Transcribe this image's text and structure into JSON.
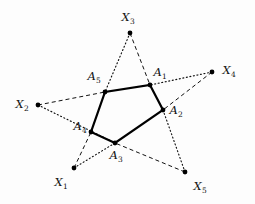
{
  "figure": {
    "background_color": "#fdfdfd",
    "stroke_color": "#111111",
    "width": 255,
    "height": 204
  },
  "pentagon": {
    "name": "inner-pentagon",
    "stroke_color": "#000000",
    "stroke_width": 2.2,
    "style": "solid",
    "vertices": [
      {
        "id": "A1",
        "label": "A",
        "subscript": "1",
        "x": 150,
        "y": 85,
        "label_x": 160,
        "label_y": 73
      },
      {
        "id": "A2",
        "label": "A",
        "subscript": "2",
        "x": 163,
        "y": 110,
        "label_x": 176,
        "label_y": 111
      },
      {
        "id": "A3",
        "label": "A",
        "subscript": "3",
        "x": 115,
        "y": 143,
        "label_x": 116,
        "label_y": 156
      },
      {
        "id": "A4",
        "label": "A",
        "subscript": "4",
        "x": 91,
        "y": 132,
        "label_x": 80,
        "label_y": 127
      },
      {
        "id": "A5",
        "label": "A",
        "subscript": "5",
        "x": 105,
        "y": 92,
        "label_x": 94,
        "label_y": 77
      }
    ]
  },
  "outer_points": [
    {
      "id": "X1",
      "label": "X",
      "subscript": "1",
      "x": 74,
      "y": 168,
      "label_x": 61,
      "label_y": 183
    },
    {
      "id": "X2",
      "label": "X",
      "subscript": "2",
      "x": 38,
      "y": 105,
      "label_x": 22,
      "label_y": 105
    },
    {
      "id": "X3",
      "label": "X",
      "subscript": "3",
      "x": 130,
      "y": 33,
      "label_x": 128,
      "label_y": 18
    },
    {
      "id": "X4",
      "label": "X",
      "subscript": "4",
      "x": 212,
      "y": 72,
      "label_x": 229,
      "label_y": 71
    },
    {
      "id": "X5",
      "label": "X",
      "subscript": "5",
      "x": 185,
      "y": 172,
      "label_x": 200,
      "label_y": 187
    }
  ],
  "connector_lines": [
    {
      "id": "X1-A4",
      "from": "X1",
      "to": "A4",
      "x1": 74,
      "y1": 168,
      "x2": 91,
      "y2": 132,
      "style": "dashed",
      "dasharray": "4,3"
    },
    {
      "id": "X1-A3",
      "from": "X1",
      "to": "A3",
      "x1": 74,
      "y1": 168,
      "x2": 115,
      "y2": 143,
      "style": "dotted",
      "dasharray": "1,2.6"
    },
    {
      "id": "X2-A5",
      "from": "X2",
      "to": "A5",
      "x1": 38,
      "y1": 105,
      "x2": 105,
      "y2": 92,
      "style": "dashed",
      "dasharray": "4,3"
    },
    {
      "id": "X2-A4",
      "from": "X2",
      "to": "A4",
      "x1": 38,
      "y1": 105,
      "x2": 115,
      "y2": 143,
      "style": "dotted",
      "dasharray": "1,2.6"
    },
    {
      "id": "X3-A1",
      "from": "X3",
      "to": "A1",
      "x1": 130,
      "y1": 33,
      "x2": 150,
      "y2": 85,
      "style": "dashed",
      "dasharray": "4,3"
    },
    {
      "id": "X3-A5",
      "from": "X3",
      "to": "A5",
      "x1": 130,
      "y1": 33,
      "x2": 105,
      "y2": 92,
      "style": "dotted",
      "dasharray": "1,2.6"
    },
    {
      "id": "X4-A2",
      "from": "X4",
      "to": "A2",
      "x1": 212,
      "y1": 72,
      "x2": 163,
      "y2": 110,
      "style": "dashed",
      "dasharray": "4,3"
    },
    {
      "id": "X4-A1",
      "from": "X4",
      "to": "A1",
      "x1": 212,
      "y1": 72,
      "x2": 150,
      "y2": 85,
      "style": "dotted",
      "dasharray": "1,2.6"
    },
    {
      "id": "X5-A3",
      "from": "X5",
      "to": "A3",
      "x1": 185,
      "y1": 172,
      "x2": 115,
      "y2": 143,
      "style": "dashed",
      "dasharray": "4,3"
    },
    {
      "id": "X5-A2",
      "from": "X5",
      "to": "A2",
      "x1": 185,
      "y1": 172,
      "x2": 163,
      "y2": 110,
      "style": "dotted",
      "dasharray": "1,2.6"
    }
  ],
  "markers": {
    "vertex_dot_radius": 2.4,
    "outer_dot_radius": 2.4,
    "dot_color": "#000000"
  }
}
